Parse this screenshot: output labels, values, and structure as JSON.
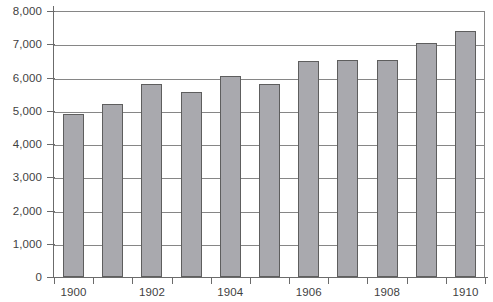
{
  "chart_data": {
    "type": "bar",
    "title": "",
    "subtitle": "",
    "xlabel": "",
    "ylabel": "",
    "categories": [
      "1900",
      "1901",
      "1902",
      "1903",
      "1904",
      "1905",
      "1906",
      "1907",
      "1908",
      "1909",
      "1910"
    ],
    "values": [
      4900,
      5200,
      5800,
      5550,
      6050,
      5800,
      6500,
      6520,
      6520,
      7050,
      7400
    ],
    "series": [
      {
        "name": "",
        "values": [
          4900,
          5200,
          5800,
          5550,
          6050,
          5800,
          6500,
          6520,
          6520,
          7050,
          7400
        ]
      }
    ],
    "ylim": [
      0,
      8000
    ],
    "y_ticks": [
      0,
      1000,
      2000,
      3000,
      4000,
      5000,
      6000,
      7000,
      8000
    ],
    "y_tick_labels": [
      "0",
      "1,000",
      "2,000",
      "3,000",
      "4,000",
      "5,000",
      "6,000",
      "7,000",
      "8,000"
    ],
    "x_tick_labels_shown": [
      "1900",
      "1902",
      "1904",
      "1906",
      "1908",
      "1910"
    ],
    "grid": true,
    "grid_axis": "y",
    "legend": false,
    "legend_position": "none",
    "bar_color": "#a9a9ae",
    "bar_border_color": "#5e5e5e",
    "gridline_color": "#868686",
    "axis_color": "#6b6b6b",
    "text_color": "#3f3f3f",
    "background_color": "#ffffff"
  }
}
